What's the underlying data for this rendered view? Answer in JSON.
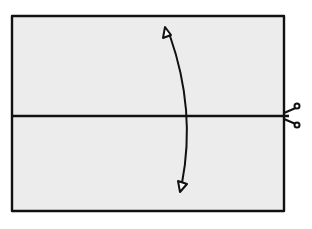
{
  "diagram": {
    "colors": {
      "paper": "#ececec",
      "stroke": "#111111",
      "background": "#ffffff"
    },
    "sheet": {
      "x": 12,
      "y": 16,
      "width": 272,
      "height": 195
    },
    "cut_line": {
      "y": 116,
      "icon": "scissors-icon"
    },
    "fold_arrow": {
      "type": "double-headed curved arrow",
      "top": [
        165,
        28
      ],
      "bottom": [
        180,
        190
      ]
    }
  }
}
